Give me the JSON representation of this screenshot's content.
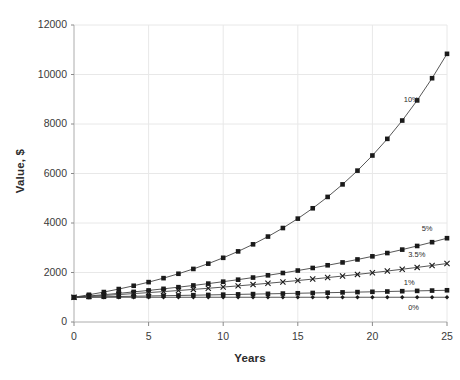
{
  "chart_data": {
    "type": "line",
    "title": "",
    "subtitle": "",
    "xlabel": "Years",
    "ylabel": "Value, $",
    "xlim": [
      0,
      25
    ],
    "ylim": [
      0,
      12000
    ],
    "xticks": [
      0,
      5,
      10,
      15,
      20,
      25
    ],
    "yticks": [
      0,
      2000,
      4000,
      6000,
      8000,
      10000,
      12000
    ],
    "xtick_labels": [
      "0",
      "5",
      "10",
      "15",
      "20",
      "25"
    ],
    "ytick_labels": [
      "0",
      "2000",
      "4000",
      "6000",
      "8000",
      "10000",
      "12000"
    ],
    "grid": true,
    "grid_color": "#e8e8e8",
    "legend_position": "inline-right-labels",
    "line_color": "#444444",
    "marker_color": "#1a1a1a",
    "x": [
      0,
      1,
      2,
      3,
      4,
      5,
      6,
      7,
      8,
      9,
      10,
      11,
      12,
      13,
      14,
      15,
      16,
      17,
      18,
      19,
      20,
      21,
      22,
      23,
      24,
      25
    ],
    "series": [
      {
        "name": "10%",
        "label": "10%",
        "marker": "square",
        "values": [
          1000,
          1100,
          1210,
          1331,
          1464,
          1611,
          1772,
          1949,
          2144,
          2358,
          2594,
          2853,
          3138,
          3452,
          3797,
          4177,
          4595,
          5054,
          5560,
          6116,
          6727,
          7400,
          8140,
          8954,
          9850,
          10835
        ]
      },
      {
        "name": "5%",
        "label": "5%",
        "marker": "square",
        "values": [
          1000,
          1050,
          1103,
          1158,
          1216,
          1276,
          1340,
          1407,
          1477,
          1551,
          1629,
          1710,
          1796,
          1886,
          1980,
          2079,
          2183,
          2292,
          2407,
          2527,
          2653,
          2786,
          2925,
          3072,
          3225,
          3386
        ]
      },
      {
        "name": "3.5%",
        "label": "3.5%",
        "marker": "cross",
        "values": [
          1000,
          1035,
          1071,
          1109,
          1148,
          1188,
          1229,
          1272,
          1317,
          1363,
          1411,
          1460,
          1511,
          1564,
          1619,
          1675,
          1734,
          1795,
          1857,
          1923,
          1990,
          2059,
          2132,
          2206,
          2283,
          2363
        ]
      },
      {
        "name": "1%",
        "label": "1%",
        "marker": "square",
        "values": [
          1000,
          1010,
          1020,
          1030,
          1041,
          1051,
          1062,
          1072,
          1083,
          1094,
          1105,
          1116,
          1127,
          1138,
          1149,
          1161,
          1173,
          1184,
          1196,
          1208,
          1220,
          1232,
          1245,
          1257,
          1270,
          1282
        ]
      },
      {
        "name": "0%",
        "label": "0%",
        "marker": "diamond",
        "values": [
          1000,
          1000,
          1000,
          1000,
          1000,
          1000,
          1000,
          1000,
          1000,
          1000,
          1000,
          1000,
          1000,
          1000,
          1000,
          1000,
          1000,
          1000,
          1000,
          1000,
          1000,
          1000,
          1000,
          1000,
          1000,
          1000
        ]
      }
    ],
    "series_label_positions": [
      {
        "label": "10%",
        "x": 22.1,
        "y": 8950
      },
      {
        "label": "5%",
        "x": 23.3,
        "y": 3760
      },
      {
        "label": "3.5%",
        "x": 22.4,
        "y": 2700
      },
      {
        "label": "1%",
        "x": 22.1,
        "y": 1560
      },
      {
        "label": "0%",
        "x": 22.4,
        "y": 560
      }
    ]
  }
}
